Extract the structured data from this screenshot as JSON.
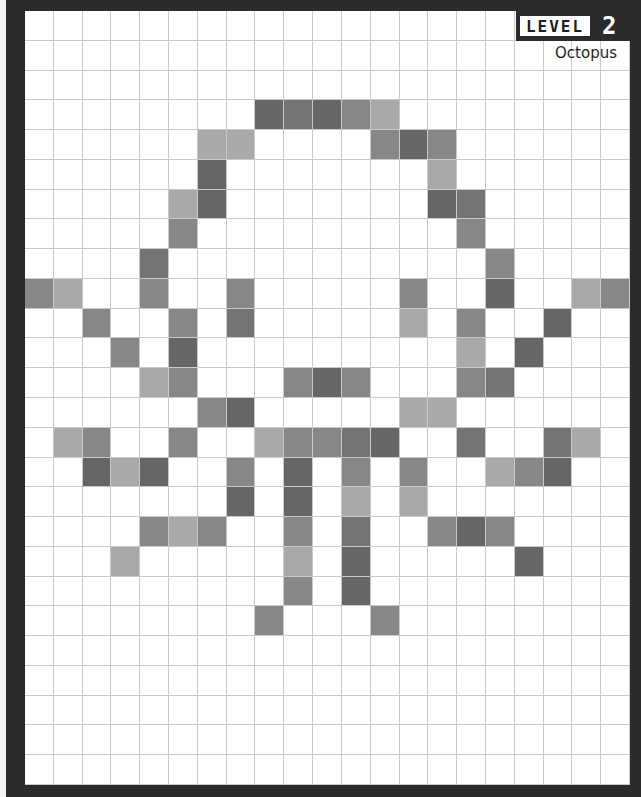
{
  "header": {
    "level_label": "LEVEL",
    "level_number": "2",
    "puzzle_name": "Octopus"
  },
  "board": {
    "columns": 21,
    "rows": 26,
    "shades": {
      "D": "#666666",
      "M2": "#747474",
      "M": "#878787",
      "L": "#a9a9a9",
      "empty": "#ffffff",
      "grid_line": "#c9c9c9"
    },
    "filled_cells": [
      {
        "r": 3,
        "c": 8,
        "s": "D"
      },
      {
        "r": 3,
        "c": 9,
        "s": "M2"
      },
      {
        "r": 3,
        "c": 10,
        "s": "D"
      },
      {
        "r": 3,
        "c": 11,
        "s": "M"
      },
      {
        "r": 3,
        "c": 12,
        "s": "L"
      },
      {
        "r": 4,
        "c": 6,
        "s": "L"
      },
      {
        "r": 4,
        "c": 7,
        "s": "L"
      },
      {
        "r": 4,
        "c": 12,
        "s": "M"
      },
      {
        "r": 4,
        "c": 13,
        "s": "D"
      },
      {
        "r": 4,
        "c": 14,
        "s": "M"
      },
      {
        "r": 5,
        "c": 6,
        "s": "D"
      },
      {
        "r": 5,
        "c": 14,
        "s": "L"
      },
      {
        "r": 6,
        "c": 5,
        "s": "L"
      },
      {
        "r": 6,
        "c": 6,
        "s": "D"
      },
      {
        "r": 6,
        "c": 14,
        "s": "D"
      },
      {
        "r": 6,
        "c": 15,
        "s": "M2"
      },
      {
        "r": 7,
        "c": 5,
        "s": "M"
      },
      {
        "r": 7,
        "c": 15,
        "s": "M"
      },
      {
        "r": 8,
        "c": 4,
        "s": "M2"
      },
      {
        "r": 8,
        "c": 16,
        "s": "M"
      },
      {
        "r": 9,
        "c": 0,
        "s": "M"
      },
      {
        "r": 9,
        "c": 1,
        "s": "L"
      },
      {
        "r": 9,
        "c": 4,
        "s": "M"
      },
      {
        "r": 9,
        "c": 7,
        "s": "M"
      },
      {
        "r": 9,
        "c": 13,
        "s": "M"
      },
      {
        "r": 9,
        "c": 16,
        "s": "D"
      },
      {
        "r": 9,
        "c": 19,
        "s": "L"
      },
      {
        "r": 9,
        "c": 20,
        "s": "M"
      },
      {
        "r": 10,
        "c": 2,
        "s": "M"
      },
      {
        "r": 10,
        "c": 5,
        "s": "M"
      },
      {
        "r": 10,
        "c": 7,
        "s": "M2"
      },
      {
        "r": 10,
        "c": 13,
        "s": "L"
      },
      {
        "r": 10,
        "c": 15,
        "s": "M"
      },
      {
        "r": 10,
        "c": 18,
        "s": "D"
      },
      {
        "r": 11,
        "c": 3,
        "s": "M"
      },
      {
        "r": 11,
        "c": 5,
        "s": "D"
      },
      {
        "r": 11,
        "c": 15,
        "s": "L"
      },
      {
        "r": 11,
        "c": 17,
        "s": "D"
      },
      {
        "r": 12,
        "c": 4,
        "s": "L"
      },
      {
        "r": 12,
        "c": 5,
        "s": "M"
      },
      {
        "r": 12,
        "c": 9,
        "s": "M"
      },
      {
        "r": 12,
        "c": 10,
        "s": "D"
      },
      {
        "r": 12,
        "c": 11,
        "s": "M"
      },
      {
        "r": 12,
        "c": 15,
        "s": "M"
      },
      {
        "r": 12,
        "c": 16,
        "s": "M2"
      },
      {
        "r": 13,
        "c": 6,
        "s": "M"
      },
      {
        "r": 13,
        "c": 7,
        "s": "D"
      },
      {
        "r": 13,
        "c": 13,
        "s": "L"
      },
      {
        "r": 13,
        "c": 14,
        "s": "L"
      },
      {
        "r": 14,
        "c": 1,
        "s": "L"
      },
      {
        "r": 14,
        "c": 2,
        "s": "M"
      },
      {
        "r": 14,
        "c": 5,
        "s": "M"
      },
      {
        "r": 14,
        "c": 8,
        "s": "L"
      },
      {
        "r": 14,
        "c": 9,
        "s": "M"
      },
      {
        "r": 14,
        "c": 10,
        "s": "M"
      },
      {
        "r": 14,
        "c": 11,
        "s": "M2"
      },
      {
        "r": 14,
        "c": 12,
        "s": "D"
      },
      {
        "r": 14,
        "c": 15,
        "s": "M2"
      },
      {
        "r": 14,
        "c": 18,
        "s": "M2"
      },
      {
        "r": 14,
        "c": 19,
        "s": "L"
      },
      {
        "r": 15,
        "c": 2,
        "s": "D"
      },
      {
        "r": 15,
        "c": 3,
        "s": "L"
      },
      {
        "r": 15,
        "c": 4,
        "s": "D"
      },
      {
        "r": 15,
        "c": 7,
        "s": "M"
      },
      {
        "r": 15,
        "c": 9,
        "s": "D"
      },
      {
        "r": 15,
        "c": 11,
        "s": "M"
      },
      {
        "r": 15,
        "c": 13,
        "s": "M"
      },
      {
        "r": 15,
        "c": 16,
        "s": "L"
      },
      {
        "r": 15,
        "c": 17,
        "s": "M"
      },
      {
        "r": 15,
        "c": 18,
        "s": "D"
      },
      {
        "r": 16,
        "c": 7,
        "s": "D"
      },
      {
        "r": 16,
        "c": 9,
        "s": "D"
      },
      {
        "r": 16,
        "c": 11,
        "s": "L"
      },
      {
        "r": 16,
        "c": 13,
        "s": "L"
      },
      {
        "r": 17,
        "c": 4,
        "s": "M"
      },
      {
        "r": 17,
        "c": 5,
        "s": "L"
      },
      {
        "r": 17,
        "c": 6,
        "s": "M"
      },
      {
        "r": 17,
        "c": 9,
        "s": "M"
      },
      {
        "r": 17,
        "c": 11,
        "s": "M2"
      },
      {
        "r": 17,
        "c": 14,
        "s": "M"
      },
      {
        "r": 17,
        "c": 15,
        "s": "D"
      },
      {
        "r": 17,
        "c": 16,
        "s": "M"
      },
      {
        "r": 18,
        "c": 3,
        "s": "L"
      },
      {
        "r": 18,
        "c": 9,
        "s": "L"
      },
      {
        "r": 18,
        "c": 11,
        "s": "D"
      },
      {
        "r": 18,
        "c": 17,
        "s": "D"
      },
      {
        "r": 19,
        "c": 9,
        "s": "M"
      },
      {
        "r": 19,
        "c": 11,
        "s": "D"
      },
      {
        "r": 20,
        "c": 8,
        "s": "M"
      },
      {
        "r": 20,
        "c": 12,
        "s": "M"
      }
    ]
  }
}
